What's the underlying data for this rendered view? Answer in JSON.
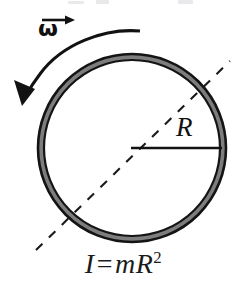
{
  "figure": {
    "width": 247,
    "height": 289,
    "background_color": "#ffffff"
  },
  "labels": {
    "omega_symbol": "ω",
    "omega_meaning": "angular-velocity-vector",
    "radius_symbol": "R",
    "equation_lhs": "I",
    "equation_operator": "=",
    "equation_rhs_mass": "m",
    "equation_rhs_radius": "R",
    "equation_rhs_exponent": "2",
    "equation_plain": "I = mR²"
  },
  "colors": {
    "ring_fill": "#7d7d7d",
    "ring_stroke": "#151515",
    "line": "#1a1a1a",
    "text": "#111111",
    "smudge": "#e9e9ec"
  },
  "geometry": {
    "circle_center_x": 132,
    "circle_center_y": 148,
    "circle_outer_radius": 94,
    "circle_inner_radius": 88,
    "ring_band_width": 6,
    "radius_line_start_x": 132,
    "radius_line_start_y": 148,
    "radius_line_end_x": 221,
    "radius_line_end_y": 148,
    "dashed_axis_angle_deg": -42,
    "rotation_arrow_direction": "counterclockwise"
  },
  "elements": {
    "ring_name": "hoop-ring",
    "rotation_arrow_name": "rotation-arrow",
    "dashed_axis_name": "rotation-axis-dashed-line",
    "radius_line_name": "radius-line"
  }
}
